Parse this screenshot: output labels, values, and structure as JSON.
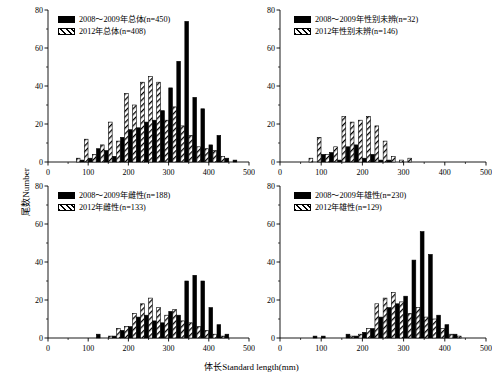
{
  "figure": {
    "xlabel": "体长Standard length(mm)",
    "ylabel": "尾数Number",
    "width": 503,
    "height": 384,
    "series_colors": {
      "solid": "#000000",
      "hatched": "#ffffff"
    }
  },
  "chart_data": [
    {
      "id": "panel-total",
      "type": "bar",
      "title": "",
      "xlabel": "体长Standard length(mm)",
      "ylabel": "尾数Number",
      "xlim": [
        0,
        500
      ],
      "ylim": [
        0,
        80
      ],
      "xticks": [
        0,
        100,
        200,
        300,
        400,
        500
      ],
      "yticks": [
        0,
        20,
        40,
        60,
        80
      ],
      "grid": false,
      "legend_position": "upper-left",
      "bin_width": 20,
      "x": [
        70,
        90,
        110,
        130,
        150,
        170,
        190,
        210,
        230,
        250,
        270,
        290,
        310,
        330,
        350,
        370,
        390,
        410,
        430,
        450,
        470
      ],
      "series": [
        {
          "name": "2008～2009年总体(n=450)",
          "style": "solid",
          "values": [
            0,
            1,
            2,
            7,
            6,
            3,
            13,
            17,
            18,
            21,
            22,
            27,
            39,
            53,
            74,
            34,
            28,
            9,
            14,
            2,
            1
          ]
        },
        {
          "name": "2012年总体(n=408)",
          "style": "hatched",
          "values": [
            2,
            12,
            4,
            9,
            21,
            11,
            36,
            30,
            42,
            45,
            42,
            22,
            29,
            19,
            14,
            8,
            7,
            6,
            3,
            0,
            0
          ]
        }
      ]
    },
    {
      "id": "panel-unsexed",
      "type": "bar",
      "title": "",
      "xlabel": "体长Standard length(mm)",
      "ylabel": "尾数Number",
      "xlim": [
        0,
        500
      ],
      "ylim": [
        0,
        80
      ],
      "xticks": [
        0,
        100,
        200,
        300,
        400,
        500
      ],
      "yticks": [
        0,
        20,
        40,
        60,
        80
      ],
      "grid": false,
      "legend_position": "upper-left",
      "bin_width": 20,
      "x": [
        70,
        90,
        110,
        130,
        150,
        170,
        190,
        210,
        230,
        250,
        270,
        290,
        310,
        330,
        350,
        370,
        390,
        410,
        430,
        450,
        470
      ],
      "series": [
        {
          "name": "2008～2009年性别未辨(n=32)",
          "style": "solid",
          "values": [
            0,
            0,
            4,
            5,
            1,
            8,
            9,
            2,
            4,
            1,
            1,
            0,
            0,
            0,
            0,
            0,
            0,
            0,
            0,
            0,
            0
          ]
        },
        {
          "name": "2012年性别未辨(n=146)",
          "style": "hatched",
          "values": [
            2,
            13,
            4,
            8,
            24,
            21,
            22,
            24,
            19,
            11,
            3,
            1,
            2,
            0,
            0,
            0,
            0,
            0,
            0,
            0,
            0
          ]
        }
      ]
    },
    {
      "id": "panel-female",
      "type": "bar",
      "title": "",
      "xlabel": "体长Standard length(mm)",
      "ylabel": "尾数Number",
      "xlim": [
        0,
        500
      ],
      "ylim": [
        0,
        80
      ],
      "xticks": [
        0,
        100,
        200,
        300,
        400,
        500
      ],
      "yticks": [
        0,
        20,
        40,
        60,
        80
      ],
      "grid": false,
      "legend_position": "upper-left",
      "bin_width": 20,
      "x": [
        70,
        90,
        110,
        130,
        150,
        170,
        190,
        210,
        230,
        250,
        270,
        290,
        310,
        330,
        350,
        370,
        390,
        410,
        430,
        450,
        470
      ],
      "series": [
        {
          "name": "2008～2009年雌性(n=188)",
          "style": "solid",
          "values": [
            0,
            0,
            0,
            2,
            0,
            1,
            4,
            6,
            11,
            12,
            9,
            8,
            14,
            12,
            30,
            33,
            30,
            16,
            7,
            2,
            0
          ]
        },
        {
          "name": "2012年雌性(n=133)",
          "style": "hatched",
          "values": [
            0,
            0,
            0,
            0,
            1,
            5,
            6,
            13,
            18,
            21,
            16,
            12,
            15,
            9,
            8,
            6,
            4,
            2,
            1,
            0,
            0
          ]
        }
      ]
    },
    {
      "id": "panel-male",
      "type": "bar",
      "title": "",
      "xlabel": "体长Standard length(mm)",
      "ylabel": "尾数Number",
      "xlim": [
        0,
        500
      ],
      "ylim": [
        0,
        80
      ],
      "xticks": [
        0,
        100,
        200,
        300,
        400,
        500
      ],
      "yticks": [
        0,
        20,
        40,
        60,
        80
      ],
      "grid": false,
      "legend_position": "upper-left",
      "bin_width": 20,
      "x": [
        70,
        90,
        110,
        130,
        150,
        170,
        190,
        210,
        230,
        250,
        270,
        290,
        310,
        330,
        350,
        370,
        390,
        410,
        430,
        450,
        470
      ],
      "series": [
        {
          "name": "2008～2009年雄性(n=230)",
          "style": "solid",
          "values": [
            0,
            1,
            1,
            0,
            0,
            2,
            1,
            3,
            5,
            11,
            16,
            18,
            22,
            41,
            56,
            44,
            12,
            7,
            2,
            0,
            0
          ]
        },
        {
          "name": "2012年雄性(n=129)",
          "style": "hatched",
          "values": [
            0,
            0,
            0,
            0,
            0,
            1,
            2,
            5,
            18,
            21,
            24,
            19,
            13,
            16,
            11,
            10,
            5,
            2,
            1,
            0,
            0
          ]
        }
      ]
    }
  ]
}
